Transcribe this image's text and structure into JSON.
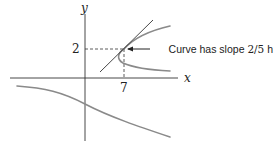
{
  "diagram": {
    "axes": {
      "x_label": "x",
      "y_label": "y"
    },
    "marked_point": {
      "x_tick_label": "7",
      "y_tick_label": "2",
      "x": 7,
      "y": 2
    },
    "annotation": {
      "text_prefix": "Curve has slope ",
      "slope": "2/5",
      "text_suffix": " here"
    },
    "colors": {
      "curve": "#8a8a8a",
      "axes": "#333333",
      "text": "#222222"
    }
  }
}
